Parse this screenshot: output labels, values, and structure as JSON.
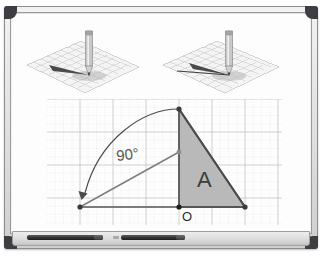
{
  "scene": {
    "type": "whiteboard-geometry-illustration",
    "surface_color": "#fdfdfd",
    "frame_color": "#dcdcdc",
    "corner_color": "#3e3e42"
  },
  "tray": {
    "markers": [
      {
        "name": "black-marker",
        "color": "#2e2e2e"
      },
      {
        "name": "black-marker-capped",
        "color": "#2e2e2e",
        "cap_color": "#a9a9a9"
      }
    ]
  },
  "illustrations": [
    {
      "name": "pencil-on-plane-single-vector",
      "caption": "",
      "pencil_color": "#9a9a9a",
      "plane_color": "#bdbdbd",
      "vectors": 1,
      "shadow": true
    },
    {
      "name": "pencil-on-plane-two-vectors",
      "caption": "",
      "pencil_color": "#9a9a9a",
      "plane_color": "#bdbdbd",
      "vectors": 2,
      "shadow": true
    }
  ],
  "graph": {
    "grid": {
      "major_color": "#c9c9c9",
      "minor_color": "#d9d9d9",
      "major_step": 33,
      "minor_step": 8.25
    },
    "labels": {
      "angle": "90°",
      "origin": "O",
      "region": "A"
    },
    "triangle": {
      "label": "A",
      "fill": "#b9b9b9",
      "stroke": "#565656",
      "vertices": [
        "O",
        "top",
        "right"
      ]
    },
    "vectors": {
      "original_color": "#7a7a7a",
      "rotated_color": "#7a7a7a",
      "arc_color": "#4a4a4a",
      "rotation_degrees": 90
    }
  }
}
